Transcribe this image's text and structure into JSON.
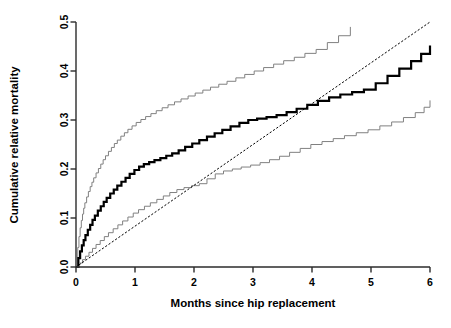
{
  "chart_data": {
    "type": "line",
    "title": "",
    "xlabel": "Months since hip replacement",
    "ylabel": "Cumulative relative mortality",
    "xlim": [
      0,
      6
    ],
    "ylim": [
      0,
      0.5
    ],
    "xticks": [
      0,
      1,
      2,
      3,
      4,
      5,
      6
    ],
    "xtick_labels": [
      "0",
      "1",
      "2",
      "3",
      "4",
      "5",
      "6"
    ],
    "yticks": [
      0.0,
      0.1,
      0.2,
      0.3,
      0.4,
      0.5
    ],
    "ytick_labels": [
      "0.0",
      "0.1",
      "0.2",
      "0.3",
      "0.4",
      "0.5"
    ],
    "grid": false,
    "legend": "none",
    "step_style": "post",
    "series": [
      {
        "name": "Upper 95% confidence limit",
        "style": "step",
        "color": "#808080",
        "width": 1.0,
        "x": [
          0.0,
          0.03,
          0.05,
          0.07,
          0.09,
          0.11,
          0.13,
          0.15,
          0.18,
          0.21,
          0.24,
          0.27,
          0.3,
          0.34,
          0.38,
          0.42,
          0.46,
          0.5,
          0.55,
          0.6,
          0.65,
          0.7,
          0.76,
          0.82,
          0.88,
          0.95,
          1.02,
          1.1,
          1.18,
          1.27,
          1.36,
          1.46,
          1.56,
          1.67,
          1.78,
          1.9,
          2.02,
          2.15,
          2.28,
          2.42,
          2.56,
          2.71,
          2.86,
          3.02,
          3.18,
          3.35,
          3.52,
          3.7,
          3.88,
          4.07,
          4.26,
          4.45,
          4.65
        ],
        "y": [
          0.0,
          0.04,
          0.062,
          0.08,
          0.095,
          0.108,
          0.12,
          0.131,
          0.143,
          0.154,
          0.164,
          0.173,
          0.182,
          0.192,
          0.201,
          0.21,
          0.219,
          0.227,
          0.236,
          0.244,
          0.252,
          0.259,
          0.267,
          0.274,
          0.281,
          0.288,
          0.295,
          0.301,
          0.307,
          0.313,
          0.319,
          0.325,
          0.331,
          0.337,
          0.343,
          0.349,
          0.355,
          0.361,
          0.367,
          0.373,
          0.379,
          0.386,
          0.393,
          0.4,
          0.407,
          0.414,
          0.421,
          0.428,
          0.436,
          0.444,
          0.458,
          0.472,
          0.49
        ]
      },
      {
        "name": "Cumulative relative mortality estimate",
        "style": "step",
        "color": "#000000",
        "width": 2.2,
        "x": [
          0.0,
          0.04,
          0.07,
          0.1,
          0.13,
          0.16,
          0.2,
          0.24,
          0.28,
          0.32,
          0.37,
          0.42,
          0.47,
          0.52,
          0.58,
          0.64,
          0.7,
          0.77,
          0.84,
          0.91,
          0.99,
          1.07,
          1.15,
          1.24,
          1.33,
          1.43,
          1.53,
          1.63,
          1.74,
          1.85,
          1.97,
          2.09,
          2.22,
          2.35,
          2.48,
          2.62,
          2.77,
          2.92,
          3.07,
          3.23,
          3.4,
          3.57,
          3.74,
          3.92,
          4.1,
          4.29,
          4.48,
          4.68,
          4.88,
          5.08,
          5.28,
          5.48,
          5.68,
          5.85,
          6.0
        ],
        "y": [
          0.0,
          0.018,
          0.032,
          0.044,
          0.055,
          0.065,
          0.076,
          0.086,
          0.096,
          0.105,
          0.115,
          0.124,
          0.133,
          0.141,
          0.15,
          0.158,
          0.166,
          0.174,
          0.182,
          0.19,
          0.198,
          0.205,
          0.21,
          0.214,
          0.218,
          0.222,
          0.227,
          0.232,
          0.238,
          0.245,
          0.252,
          0.259,
          0.266,
          0.273,
          0.28,
          0.287,
          0.294,
          0.3,
          0.303,
          0.306,
          0.31,
          0.316,
          0.323,
          0.331,
          0.339,
          0.346,
          0.352,
          0.357,
          0.362,
          0.375,
          0.39,
          0.405,
          0.42,
          0.435,
          0.452
        ]
      },
      {
        "name": "Lower 95% confidence limit",
        "style": "step",
        "color": "#808080",
        "width": 1.0,
        "x": [
          0.0,
          0.06,
          0.11,
          0.16,
          0.22,
          0.28,
          0.34,
          0.41,
          0.48,
          0.55,
          0.63,
          0.71,
          0.79,
          0.88,
          0.97,
          1.06,
          1.16,
          1.26,
          1.37,
          1.48,
          1.59,
          1.71,
          1.83,
          1.96,
          2.09,
          2.22,
          2.36,
          2.5,
          2.65,
          2.8,
          2.96,
          3.12,
          3.28,
          3.45,
          3.62,
          3.8,
          3.98,
          4.17,
          4.36,
          4.55,
          4.75,
          4.95,
          5.15,
          5.35,
          5.55,
          5.75,
          5.9,
          6.0
        ],
        "y": [
          0.0,
          0.008,
          0.015,
          0.022,
          0.03,
          0.038,
          0.046,
          0.054,
          0.062,
          0.07,
          0.078,
          0.086,
          0.094,
          0.102,
          0.11,
          0.117,
          0.124,
          0.131,
          0.138,
          0.145,
          0.152,
          0.158,
          0.162,
          0.166,
          0.17,
          0.18,
          0.19,
          0.196,
          0.2,
          0.204,
          0.208,
          0.213,
          0.219,
          0.226,
          0.234,
          0.242,
          0.25,
          0.256,
          0.262,
          0.268,
          0.274,
          0.28,
          0.288,
          0.296,
          0.305,
          0.315,
          0.326,
          0.34
        ]
      },
      {
        "name": "Reference line",
        "style": "dotted",
        "color": "#000000",
        "width": 1.0,
        "x": [
          0.0,
          6.0
        ],
        "y": [
          0.0,
          0.5
        ]
      }
    ]
  }
}
